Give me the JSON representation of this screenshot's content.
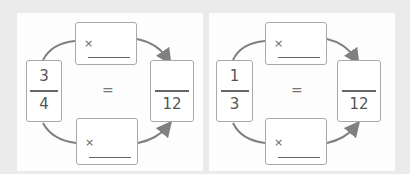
{
  "problems": [
    {
      "fraction": {
        "numerator": "3",
        "denominator": "4"
      },
      "top_operator": "×",
      "bottom_operator": "×",
      "equals": "=",
      "result": {
        "numerator": "",
        "denominator": "12"
      }
    },
    {
      "fraction": {
        "numerator": "1",
        "denominator": "3"
      },
      "top_operator": "×",
      "bottom_operator": "×",
      "equals": "=",
      "result": {
        "numerator": "",
        "denominator": "12"
      }
    }
  ],
  "colors": {
    "arrow": "#808080",
    "border": "#a9a9a9",
    "background": "#ebebeb"
  }
}
